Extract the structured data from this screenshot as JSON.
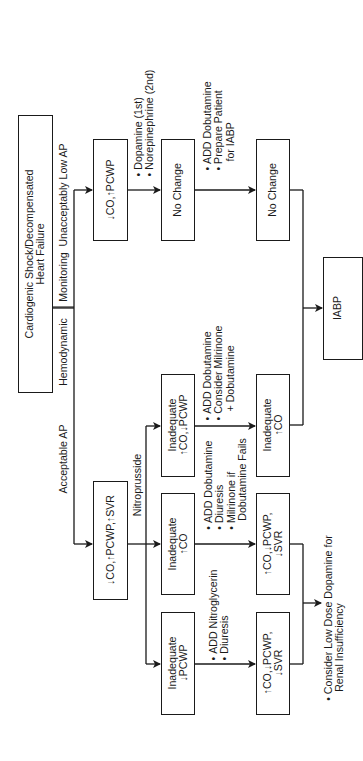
{
  "diagram": {
    "root": {
      "lines": [
        "Cardiogenic Shock/Decompensated",
        "Heart Failure"
      ]
    },
    "monitoring": {
      "left_label": "Hemodynamic",
      "right_label": "Monitoring"
    },
    "branches": {
      "acceptable_ap": "Acceptable AP",
      "unacceptably_low_ap": "Unacceptably Low AP",
      "nitroprusside": "Nitroprusside"
    },
    "low_ap_path": {
      "state_box": "↓CO,↑PCWP",
      "step1_actions": [
        "Dopamine (1st)",
        "Norepinephrine (2nd)"
      ],
      "result1": "No Change",
      "step2_actions": [
        "ADD Dobutamine",
        "Prepare Patient",
        "for IABP"
      ],
      "result2": "No Change",
      "final": "IABP"
    },
    "acceptable_path": {
      "state_box": "↓CO,↑PCWP,↑SVR",
      "outcomes": [
        {
          "box": [
            "Inadequate",
            "↑CO,↓PCWP"
          ],
          "actions": [
            "ADD Dobutamine",
            "Consider Milrinone",
            "+ Dobutamine"
          ],
          "result": [
            "Inadequate",
            "↑CO"
          ]
        },
        {
          "box": [
            "Inadequate",
            "↑CO"
          ],
          "actions": [
            "ADD Dobutamine",
            "Diuresis",
            "Milrinone if",
            "Dobutamine Fails"
          ],
          "result": [
            "↑CO,↓PCWP,",
            "↓SVR"
          ]
        },
        {
          "box": [
            "Inadequate",
            "↓PCWP"
          ],
          "actions": [
            "ADD Nitroglycerin",
            "Diuresis"
          ],
          "result": [
            "↑CO,↓PCWP,",
            "↓SVR"
          ]
        }
      ],
      "final_note": [
        "Consider Low Dose Dopamine for",
        "Renal Insufficiency"
      ]
    }
  }
}
